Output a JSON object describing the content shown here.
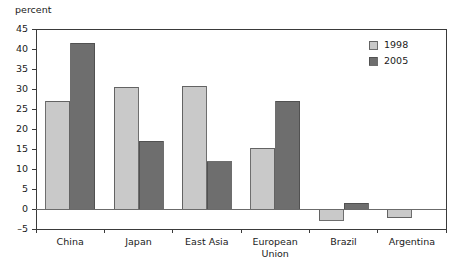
{
  "chart_data": {
    "type": "bar",
    "title": "",
    "subtitle": "",
    "xlabel": "",
    "ylabel": "percent",
    "ylim": [
      -5,
      45
    ],
    "ytick_step": 5,
    "yticks": [
      -5,
      0,
      5,
      10,
      15,
      20,
      25,
      30,
      35,
      40,
      45
    ],
    "ytick_labels": [
      "–5",
      "0",
      "5",
      "10",
      "15",
      "20",
      "25",
      "30",
      "35",
      "40",
      "45"
    ],
    "grid": false,
    "legend_position": "top-right",
    "categories": [
      "China",
      "Japan",
      "East Asia",
      "European Union",
      "Brazil",
      "Argentina"
    ],
    "category_lines": [
      [
        "China"
      ],
      [
        "Japan"
      ],
      [
        "East Asia"
      ],
      [
        "European",
        "Union"
      ],
      [
        "Brazil"
      ],
      [
        "Argentina"
      ]
    ],
    "series": [
      {
        "name": "1998",
        "color": "#c9c9c9",
        "values": [
          27.0,
          30.5,
          30.7,
          15.2,
          -2.8,
          -2.2
        ]
      },
      {
        "name": "2005",
        "color": "#6e6e6e",
        "values": [
          41.5,
          17.0,
          11.8,
          27.0,
          1.5,
          0.0
        ]
      }
    ],
    "annotations": []
  },
  "legend": {
    "entries": [
      {
        "label": "1998",
        "swatch": "light-gray-swatch"
      },
      {
        "label": "2005",
        "swatch": "dark-gray-swatch"
      }
    ]
  },
  "colors": {
    "series_1998": "#c9c9c9",
    "series_2005": "#6e6e6e",
    "axis": "#3a3a3a",
    "zero_line": "#6b6b6b",
    "bar_border": "#4a4a4a",
    "text": "#1a1a1a",
    "background": "#ffffff"
  }
}
